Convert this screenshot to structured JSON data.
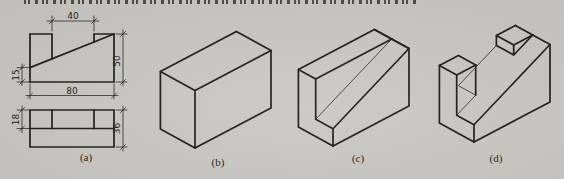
{
  "colors": {
    "paper": "#c9c8c3",
    "ink": "#1c1c1c"
  },
  "orthographic": {
    "front_view": {
      "dim_top": "40",
      "dim_right": "50",
      "dim_left": "15",
      "dim_bottom": "80"
    },
    "top_view": {
      "dim_left": "18",
      "dim_right": "36"
    }
  },
  "labels": {
    "a": "(a)",
    "b": "(b)",
    "c": "(c)",
    "d": "(d)"
  }
}
